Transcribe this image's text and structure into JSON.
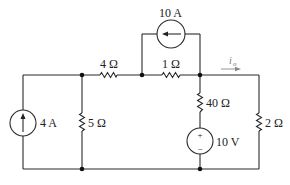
{
  "diagram": {
    "type": "electric-circuit",
    "colors": {
      "wire": "#2a2a2a",
      "label": "#222222",
      "current_label": "#777777"
    },
    "components": {
      "source_4A": {
        "kind": "current-source",
        "label": "4 A",
        "direction": "up"
      },
      "resistor_5": {
        "kind": "resistor",
        "label": "5 Ω"
      },
      "resistor_4": {
        "kind": "resistor",
        "label": "4 Ω"
      },
      "resistor_1": {
        "kind": "resistor",
        "label": "1 Ω"
      },
      "source_10A": {
        "kind": "current-source",
        "label": "10 A",
        "direction": "left"
      },
      "resistor_40": {
        "kind": "resistor",
        "label": "40 Ω"
      },
      "source_10V": {
        "kind": "voltage-source",
        "label": "10 V",
        "plus": "+",
        "minus": "−"
      },
      "resistor_2": {
        "kind": "resistor",
        "label": "2 Ω"
      }
    },
    "current_label": {
      "symbol": "i",
      "subscript": "o",
      "direction": "right"
    }
  }
}
